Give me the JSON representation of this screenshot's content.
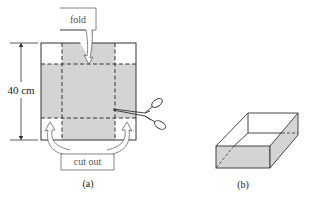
{
  "figure_a": {
    "caption": "(a)",
    "dimension_label": "40 cm",
    "fold_label": "fold",
    "cut_out_label": "cut out",
    "shade_color": "#d4d4d4",
    "line_color": "#333333"
  },
  "figure_b": {
    "caption": "(b)",
    "shade_color": "#d4d4d4"
  }
}
